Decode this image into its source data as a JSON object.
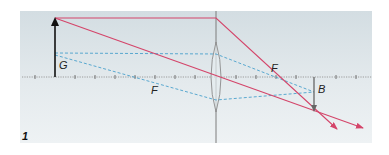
{
  "figure": {
    "number": "1"
  },
  "labels": {
    "object": "G",
    "image": "B",
    "focal_left": "F",
    "focal_right": "F"
  },
  "colors": {
    "panel_top": "#d5dee3",
    "panel_bottom": "#eef2f4",
    "ray_red": "#d4456a",
    "ray_blue": "#4aa0cc",
    "axis": "#777777",
    "arrow_object": "#111111",
    "arrow_image": "#666666",
    "lens_stroke": "#888888",
    "lens_fill": "#e6ecef"
  },
  "geometry": {
    "panel": {
      "x": 20,
      "y": 11,
      "w": 352,
      "h": 132
    },
    "axis_y": 77,
    "lens_x": 216,
    "object": {
      "x": 55,
      "top_y": 18
    },
    "image": {
      "x": 314,
      "bottom_y": 112
    },
    "focal_left_x": 155,
    "focal_right_x": 276
  }
}
